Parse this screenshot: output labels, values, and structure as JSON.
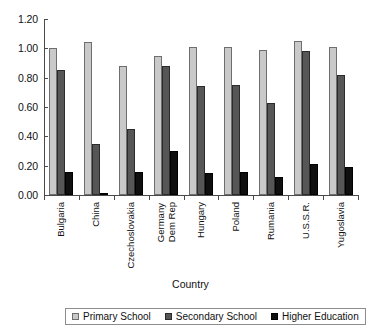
{
  "chart_data": {
    "type": "bar",
    "title": "",
    "xlabel": "Country",
    "ylabel": "",
    "ylim": [
      0.0,
      1.2
    ],
    "ytick_labels": [
      "1.20",
      "1.00",
      "0.80",
      "0.60",
      "0.40",
      "0.20",
      "0.00"
    ],
    "ytick_values": [
      1.2,
      1.0,
      0.8,
      0.6,
      0.4,
      0.2,
      0.0
    ],
    "grid": false,
    "legend_position": "bottom",
    "categories": [
      "Bulgaria",
      "China",
      "Czechoslovakia",
      "Germany\nDem Rep",
      "Hungary",
      "Poland",
      "Rumania",
      "U.S.S.R.",
      "Yugoslavia"
    ],
    "series": [
      {
        "name": "Primary School",
        "color": "#c9c9c9",
        "values": [
          1.0,
          1.04,
          0.88,
          0.95,
          1.01,
          1.01,
          0.99,
          1.05,
          1.01
        ]
      },
      {
        "name": "Secondary School",
        "color": "#565656",
        "values": [
          0.85,
          0.35,
          0.45,
          0.88,
          0.74,
          0.75,
          0.63,
          0.98,
          0.82
        ]
      },
      {
        "name": "Higher Education",
        "color": "#0f0f0f",
        "values": [
          0.16,
          0.01,
          0.16,
          0.3,
          0.15,
          0.16,
          0.12,
          0.21,
          0.19
        ]
      }
    ]
  }
}
